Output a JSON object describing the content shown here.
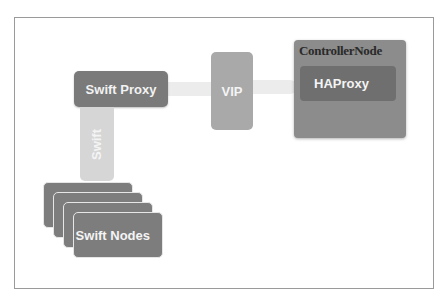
{
  "diagram": {
    "swift_proxy": {
      "label": "Swift Proxy"
    },
    "vip": {
      "label": "VIP"
    },
    "controller_node": {
      "title": "ControllerNode",
      "haproxy": {
        "label": "HAProxy"
      }
    },
    "swift_link": {
      "label": "Swift"
    },
    "swift_nodes": {
      "label": "Swift Nodes",
      "stack_count": 4
    },
    "colors": {
      "proxy": "#7a7a7a",
      "vip": "#a9a9a9",
      "controller": "#8c8c8c",
      "haproxy": "#6f6f6f",
      "connector": "#ececec",
      "swift_link": "#d6d6d6",
      "nodes": "#7d7d7d"
    }
  }
}
